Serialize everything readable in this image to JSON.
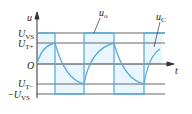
{
  "diagram": {
    "type": "waveform",
    "axes": {
      "y_label": "u",
      "x_label": "t",
      "origin_label": "O"
    },
    "levels": [
      {
        "name": "U_VS",
        "main": "U",
        "sub": "VS",
        "prefix": ""
      },
      {
        "name": "U_T+",
        "main": "U",
        "sub": "T+",
        "prefix": ""
      },
      {
        "name": "U_T-",
        "main": "U",
        "sub": "T−",
        "prefix": ""
      },
      {
        "name": "-U_VS",
        "main": "U",
        "sub": "VS",
        "prefix": "−"
      }
    ],
    "curves": [
      {
        "name": "u_o",
        "main": "u",
        "sub": "o",
        "description": "square wave output switching between U_VS and -U_VS"
      },
      {
        "name": "u_C",
        "main": "u",
        "sub": "C",
        "description": "capacitor voltage charging/discharging between U_T+ and U_T-"
      }
    ],
    "colors": {
      "waveform": "#5aaee0",
      "gridline": "#555555",
      "fill": "#e6f4fc"
    }
  }
}
